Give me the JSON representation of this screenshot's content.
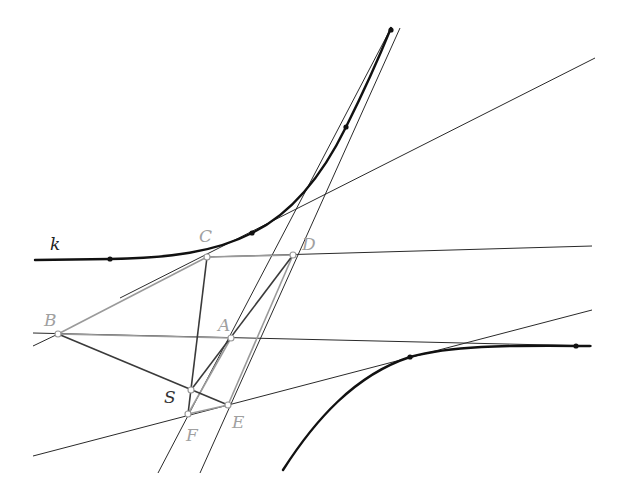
{
  "diagram": {
    "title": "",
    "colors": {
      "curve": "#111111",
      "thin_line": "#2a2a2a",
      "gray_line": "#9a9a9a",
      "dark_seg": "#3a3a3a",
      "label_gray": "#a0a0a0",
      "label_dark": "#222222"
    },
    "labels": {
      "k": "k",
      "A": "A",
      "B": "B",
      "C": "C",
      "D": "D",
      "E": "E",
      "F": "F",
      "S": "S"
    },
    "points": {
      "A": [
        231,
        338
      ],
      "B": [
        58,
        334
      ],
      "C": [
        207,
        257
      ],
      "D": [
        293,
        255
      ],
      "E": [
        228,
        405
      ],
      "F": [
        188,
        414
      ],
      "S": [
        191,
        390
      ]
    },
    "curves": [
      {
        "name": "upper-branch-k",
        "points_on_curve": [
          [
            110,
            259
          ],
          [
            252,
            233
          ],
          [
            346,
            127
          ],
          [
            391,
            28
          ]
        ]
      },
      {
        "name": "lower-branch",
        "points_on_curve": [
          [
            410,
            357
          ],
          [
            576,
            346
          ]
        ]
      }
    ]
  }
}
